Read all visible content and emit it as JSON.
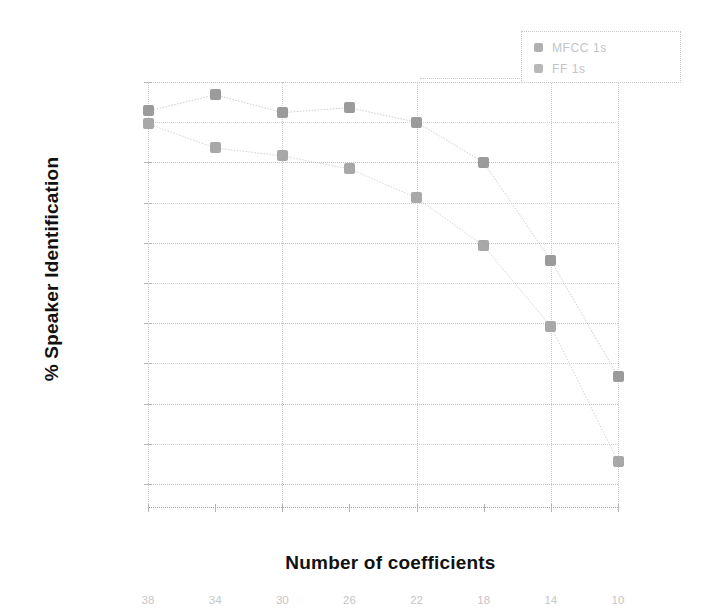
{
  "figure": {
    "ylabel": "% Speaker Identification",
    "xlabel": "Number of coefficients"
  },
  "legend": {
    "position": "top-right",
    "items": [
      {
        "label": "MFCC 1s",
        "marker": "diamond-marker",
        "color": "#b0b0b0"
      },
      {
        "label": "FF 1s",
        "marker": "square-marker",
        "color": "#b8b8b8"
      }
    ]
  },
  "chart_data": {
    "type": "line",
    "title": "",
    "xlabel": "Number of coefficients",
    "ylabel": "% Speaker Identification",
    "x": [
      38,
      34,
      30,
      26,
      22,
      18,
      14,
      10
    ],
    "xticklabels": [
      "38",
      "34",
      "30",
      "26",
      "22",
      "18",
      "14",
      "10"
    ],
    "yticklabels": [
      "85",
      "82.5",
      "80",
      "77.5",
      "75",
      "72.5",
      "70",
      "67.5",
      "65",
      "62.5",
      "60"
    ],
    "yticks": [
      85,
      82.5,
      80,
      77.5,
      75,
      72.5,
      70,
      67.5,
      65,
      62.5,
      60
    ],
    "ylim": [
      58.5,
      85
    ],
    "xlim_reversed": true,
    "grid": true,
    "legend_position": "top-right",
    "series": [
      {
        "name": "MFCC 1s",
        "color": "#9b9b9b",
        "values": [
          83.2,
          84.2,
          83.1,
          83.4,
          82.5,
          80.0,
          73.9,
          66.7
        ]
      },
      {
        "name": "FF 1s",
        "color": "#a8a8a8",
        "values": [
          82.4,
          80.9,
          80.4,
          79.6,
          77.8,
          74.8,
          69.8,
          61.4
        ]
      }
    ]
  }
}
